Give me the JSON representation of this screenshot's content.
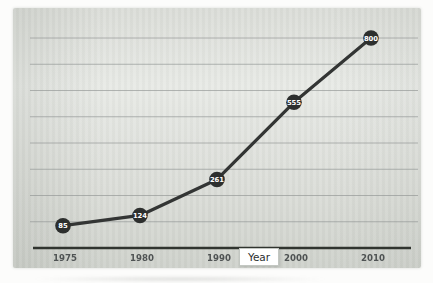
{
  "chart_data": {
    "type": "line",
    "title": "",
    "xlabel": "Year",
    "ylabel": "",
    "categories": [
      "1975",
      "1980",
      "1990",
      "2000",
      "2010"
    ],
    "values": [
      85,
      124,
      261,
      555,
      800
    ],
    "point_labels": [
      "85",
      "124",
      "261",
      "555",
      "800"
    ],
    "ylim": [
      0,
      800
    ],
    "gridline_interval": 100,
    "grid": true,
    "legend": false,
    "marker_style": "filled-circle-with-value-label"
  },
  "colors": {
    "page_background": "#fcfcfb",
    "panel_background_dark": "#cfd2cc",
    "panel_background_mid": "#dbddd8",
    "panel_background_light": "#e8eae6",
    "gridline": "#8f9392",
    "axis_line": "#30342f",
    "series_line": "#333534",
    "marker_fill": "#2d2f2e",
    "marker_label_text": "#ffffff",
    "tick_label_text": "#45494a",
    "xlabel_box_background": "#ffffff",
    "xlabel_box_border": "#c3c7c2",
    "xlabel_text": "#2c2f2f"
  }
}
